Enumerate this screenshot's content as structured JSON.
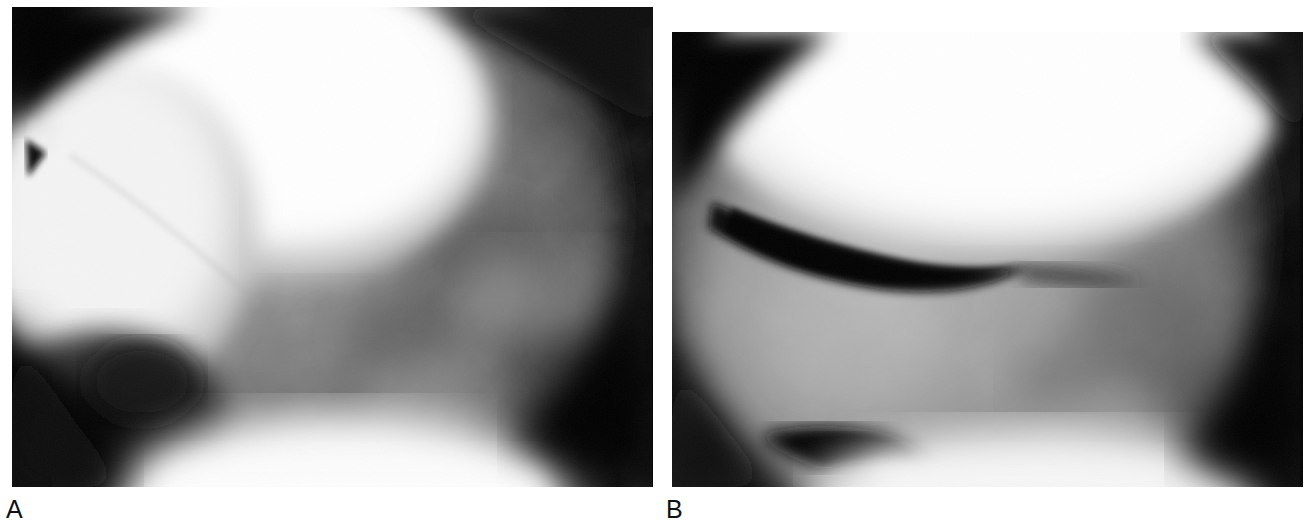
{
  "figure": {
    "type": "radiographic-figure",
    "background_color": "#ffffff",
    "panel_count": 2,
    "width": 1313,
    "height": 530
  },
  "panels": [
    {
      "id": "A",
      "caption": "A",
      "modality": "fluoroscopic-radiograph",
      "anatomy": "knee-joint-lateral-view",
      "bounds": {
        "x": 12,
        "y": 7,
        "width": 641,
        "height": 480
      },
      "background_color": "#050505",
      "field_of_view": {
        "shape": "circular-collimated",
        "center_x": 300,
        "center_y": 225,
        "radius": 300
      },
      "features": [
        {
          "name": "femoral-condyle",
          "description": "Bright rounded radiodense bone mass, upper-left to upper-center",
          "brightness": "#ffffff"
        },
        {
          "name": "patella-overlap",
          "description": "Bright rounded mass at left-middle with faint cortical line",
          "brightness": "#f2f2f2"
        },
        {
          "name": "cortical-line",
          "description": "Faint oblique line crossing the bright condyle",
          "brightness": "#d9d9d9"
        },
        {
          "name": "tibial-plateau-soft-tissue",
          "description": "Mid-grey trabecular region right of condyle",
          "brightness": "#6e6e6e"
        },
        {
          "name": "dark-notch",
          "description": "Dark recess at lower-left of field",
          "brightness": "#0b0b0b"
        },
        {
          "name": "bright-inferior-band",
          "description": "Bright band along the lower margin",
          "brightness": "#f6f6f6"
        }
      ]
    },
    {
      "id": "B",
      "caption": "B",
      "modality": "fluoroscopic-radiograph",
      "anatomy": "knee-joint-lateral-view",
      "bounds": {
        "x": 672,
        "y": 32,
        "width": 631,
        "height": 455
      },
      "background_color": "#050505",
      "field_of_view": {
        "shape": "circular-collimated",
        "center_x": 300,
        "center_y": 200,
        "radius": 300
      },
      "features": [
        {
          "name": "femoral-condyle",
          "description": "Large bright radiodense rounded bone occupying upper half",
          "brightness": "#ffffff"
        },
        {
          "name": "joint-space-lucency",
          "description": "Prominent dark crescent beneath the condyle (gas/contrast lucency)",
          "brightness": "#080808"
        },
        {
          "name": "inferior-lucency",
          "description": "Second dark crescent at lower-left of field",
          "brightness": "#121212"
        },
        {
          "name": "tibial-soft-tissue",
          "description": "Mid-grey soft tissue and trabecular texture filling lower field",
          "brightness": "#8a8a8a"
        },
        {
          "name": "bright-inferior-band",
          "description": "Bright band along the lower-right margin",
          "brightness": "#ededed"
        }
      ]
    }
  ],
  "captions": {
    "a": "A",
    "b": "B",
    "color": "#111111",
    "font_size_px": 25
  }
}
